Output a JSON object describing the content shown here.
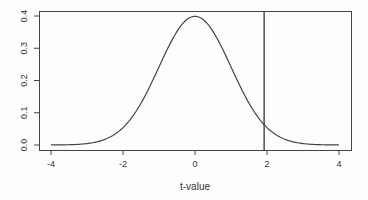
{
  "chart_data": {
    "type": "line",
    "title": "",
    "xlabel": "t-value",
    "ylabel": "",
    "xlim": [
      -4.33,
      4.33
    ],
    "ylim": [
      -0.016,
      0.415
    ],
    "x_ticks": [
      -4,
      -2,
      0,
      2,
      4
    ],
    "x_tick_labels": [
      "-4",
      "-2",
      "0",
      "2",
      "4"
    ],
    "y_ticks": [
      0.0,
      0.1,
      0.2,
      0.3,
      0.4
    ],
    "y_tick_labels": [
      "0.0",
      "0.1",
      "0.2",
      "0.3",
      "0.4"
    ],
    "grid": false,
    "legend": null,
    "series": [
      {
        "name": "t-distribution density",
        "x": [
          -4,
          -3.5,
          -3,
          -2.5,
          -2,
          -1.5,
          -1,
          -0.5,
          0,
          0.5,
          1,
          1.5,
          2,
          2.5,
          3,
          3.5,
          4
        ],
        "values": [
          0.0001,
          0.0009,
          0.0044,
          0.0175,
          0.054,
          0.1295,
          0.242,
          0.352,
          0.399,
          0.352,
          0.242,
          0.1295,
          0.054,
          0.0175,
          0.0044,
          0.0009,
          0.0001
        ]
      }
    ],
    "annotations": [
      {
        "type": "vline",
        "x": 1.92,
        "description": "vertical reference line at observed t-value"
      }
    ]
  }
}
